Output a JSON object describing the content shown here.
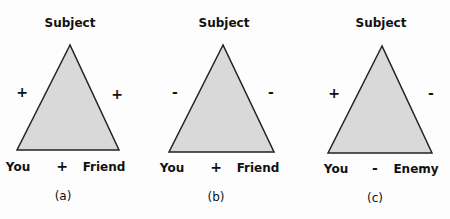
{
  "diagrams": [
    {
      "caption": "(a)",
      "apex": "Subject",
      "left": "You",
      "right": "Friend",
      "left_sign": "+",
      "right_sign": "+",
      "base_sign": "+"
    },
    {
      "caption": "(b)",
      "apex": "Subject",
      "left": "You",
      "right": "Friend",
      "left_sign": "-",
      "right_sign": "-",
      "base_sign": "+"
    },
    {
      "caption": "(c)",
      "apex": "Subject",
      "left": "You",
      "right": "Enemy",
      "left_sign": "+",
      "right_sign": "-",
      "base_sign": "-"
    }
  ],
  "colors": {
    "fill": "#d9d9d9",
    "stroke": "#222222"
  }
}
